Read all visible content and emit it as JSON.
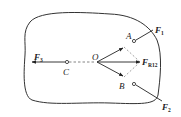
{
  "diagram": {
    "type": "rigid-body force diagram",
    "colors": {
      "stroke": "#333333",
      "dashed": "#888888",
      "background": "#ffffff"
    },
    "points": {
      "O": {
        "label": "O"
      },
      "A": {
        "label": "A"
      },
      "B": {
        "label": "B"
      },
      "C": {
        "label": "C"
      }
    },
    "forces": {
      "F1": {
        "symbol": "F",
        "subscript": "1"
      },
      "F2": {
        "symbol": "F",
        "subscript": "2"
      },
      "F3": {
        "symbol": "F",
        "subscript": "3"
      },
      "FR12": {
        "symbol": "F",
        "subscript": "R12"
      }
    }
  }
}
